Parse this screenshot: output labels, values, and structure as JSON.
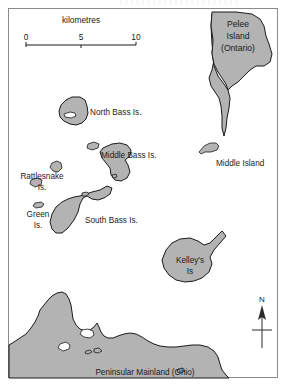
{
  "map": {
    "frame": {
      "x": 8,
      "y": 8,
      "width": 270,
      "height": 370
    },
    "scale_bar": {
      "title": "kilometres",
      "ticks": [
        "0",
        "5",
        "10"
      ]
    },
    "north_arrow": {
      "label": "N"
    },
    "labels": {
      "pelee_island": "Pelee",
      "pelee_island_line2": "Island",
      "pelee_island_line3": "(Ontario)",
      "north_bass": "North Bass Is.",
      "middle_bass": "Middle Bass Is.",
      "middle_island": "Middle Island",
      "rattlesnake_1": "Rattlesnake",
      "rattlesnake_2": "Is.",
      "green_1": "Green",
      "green_2": "Is.",
      "south_bass": "South Bass Is.",
      "kelleys_1": "Kelley's",
      "kelleys_2": "Is",
      "mainland": "Peninsular Mainland (Ohio)"
    },
    "colors": {
      "land_fill": "#b3b3b3",
      "land_stroke": "#1a1a1a",
      "frame_stroke": "#8a8a8a",
      "background": "#ffffff"
    }
  }
}
